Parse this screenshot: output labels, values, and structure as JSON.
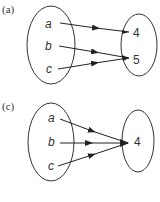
{
  "panels": [
    {
      "label": "(a)",
      "domain": [
        "a",
        "b",
        "c"
      ],
      "codomain": [
        "4",
        "5"
      ],
      "mappings": [
        {
          "from": "a",
          "to": "4"
        },
        {
          "from": "b",
          "to": "5"
        },
        {
          "from": "c",
          "to": "5"
        }
      ]
    },
    {
      "label": "(c)",
      "domain": [
        "a",
        "b",
        "c"
      ],
      "codomain": [
        "4"
      ],
      "mappings": [
        {
          "from": "a",
          "to": "4"
        },
        {
          "from": "b",
          "to": "4"
        },
        {
          "from": "c",
          "to": "4"
        }
      ]
    }
  ]
}
